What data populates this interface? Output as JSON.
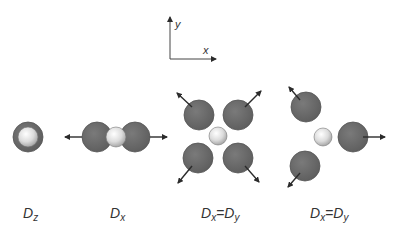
{
  "diagram": {
    "axes": {
      "x_label": "x",
      "y_label": "y"
    },
    "colors": {
      "large_atom": "#6e6e6e",
      "large_atom_edge": "#555555",
      "small_atom_light": "#f4f4f4",
      "small_atom_dark": "#bdbdbd",
      "arrow": "#2b2b2b",
      "text": "#333333"
    },
    "panels": [
      {
        "id": "dz",
        "label_main": "D",
        "label_sub": "z",
        "description": "single atom, small sphere inside large ring"
      },
      {
        "id": "dx",
        "label_main": "D",
        "label_sub": "x",
        "description": "two large atoms displaced along x"
      },
      {
        "id": "dxdy-4",
        "label_main": "D",
        "label_sub": "x",
        "label_eq": "=",
        "label_main2": "D",
        "label_sub2": "y",
        "description": "four large atoms displaced diagonally"
      },
      {
        "id": "dxdy-3",
        "label_main": "D",
        "label_sub": "x",
        "label_eq": "=",
        "label_main2": "D",
        "label_sub2": "y",
        "description": "three large atoms displaced radially"
      }
    ]
  }
}
